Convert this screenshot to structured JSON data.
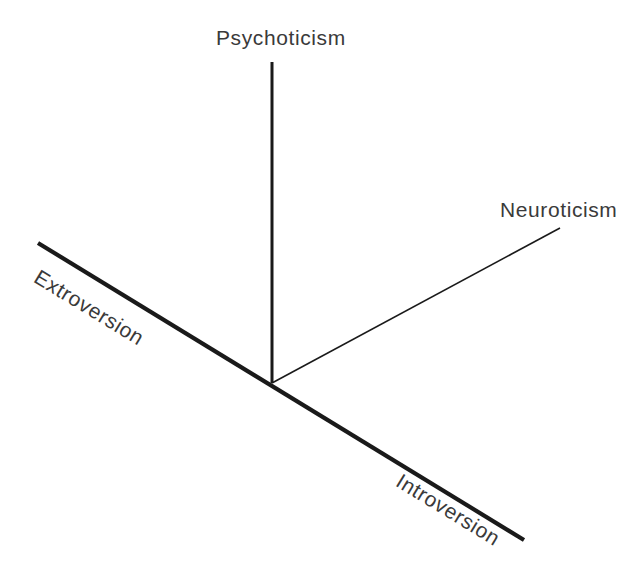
{
  "figure": {
    "width": 633,
    "height": 579,
    "background_color": "#ffffff",
    "line_color": "#1a1a1a",
    "text_color": "#3a3a3a"
  },
  "chart_data": {
    "type": "diagram",
    "title": "",
    "xlabel": "",
    "ylabel": "",
    "grid": false,
    "legend": "none",
    "origin": {
      "x": 272,
      "y": 383
    },
    "axes": [
      {
        "name": "extroversion-introversion-axis",
        "labels": [
          "Extroversion",
          "Introversion"
        ],
        "from": {
          "x": 38,
          "y": 243
        },
        "to": {
          "x": 524,
          "y": 540
        },
        "stroke_width": 4.2,
        "color": "#1a1a1a",
        "angle_deg": 31.4
      },
      {
        "name": "psychoticism-axis",
        "labels": [
          "Psychoticism"
        ],
        "from": {
          "x": 272,
          "y": 62
        },
        "to": {
          "x": 272,
          "y": 383
        },
        "stroke_width": 3.0,
        "color": "#1a1a1a",
        "angle_deg": -90
      },
      {
        "name": "neuroticism-axis",
        "labels": [
          "Neuroticism"
        ],
        "from": {
          "x": 272,
          "y": 383
        },
        "to": {
          "x": 560,
          "y": 228
        },
        "stroke_width": 1.6,
        "color": "#1a1a1a",
        "angle_deg": -28.3
      }
    ]
  },
  "labels": {
    "psychoticism": "Psychoticism",
    "neuroticism": "Neuroticism",
    "extroversion": "Extroversion",
    "introversion": "Introversion"
  }
}
